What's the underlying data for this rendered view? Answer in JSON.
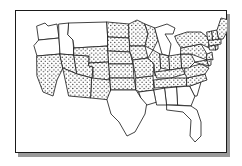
{
  "figure": {
    "frame": {
      "border_color": "#1a1a1a",
      "shadow_color": "#9a9a9a",
      "background_color": "#ffffff"
    }
  },
  "legend": {
    "shaded_meaning": "shaded (stippled) state",
    "unshaded_meaning": "unshaded (white) state",
    "stipple_color": "#1c1c1c",
    "outline_color": "#222222"
  },
  "map": {
    "region": "Contiguous United States",
    "projection": "simplified",
    "shaded_count": 35,
    "unshaded_count": 13,
    "states": [
      {
        "code": "WA",
        "name": "Washington",
        "shaded": false
      },
      {
        "code": "OR",
        "name": "Oregon",
        "shaded": false
      },
      {
        "code": "ID",
        "name": "Idaho",
        "shaded": false
      },
      {
        "code": "MT",
        "name": "Montana",
        "shaded": false
      },
      {
        "code": "CA",
        "name": "California",
        "shaded": true
      },
      {
        "code": "NV",
        "name": "Nevada",
        "shaded": true
      },
      {
        "code": "UT",
        "name": "Utah",
        "shaded": true
      },
      {
        "code": "AZ",
        "name": "Arizona",
        "shaded": true
      },
      {
        "code": "WY",
        "name": "Wyoming",
        "shaded": true
      },
      {
        "code": "CO",
        "name": "Colorado",
        "shaded": true
      },
      {
        "code": "NM",
        "name": "New Mexico",
        "shaded": true
      },
      {
        "code": "ND",
        "name": "North Dakota",
        "shaded": true
      },
      {
        "code": "SD",
        "name": "South Dakota",
        "shaded": true
      },
      {
        "code": "NE",
        "name": "Nebraska",
        "shaded": true
      },
      {
        "code": "KS",
        "name": "Kansas",
        "shaded": true
      },
      {
        "code": "OK",
        "name": "Oklahoma",
        "shaded": true
      },
      {
        "code": "TX",
        "name": "Texas",
        "shaded": false
      },
      {
        "code": "MN",
        "name": "Minnesota",
        "shaded": true
      },
      {
        "code": "IA",
        "name": "Iowa",
        "shaded": true
      },
      {
        "code": "MO",
        "name": "Missouri",
        "shaded": true
      },
      {
        "code": "AR",
        "name": "Arkansas",
        "shaded": true
      },
      {
        "code": "LA",
        "name": "Louisiana",
        "shaded": false
      },
      {
        "code": "WI",
        "name": "Wisconsin",
        "shaded": true
      },
      {
        "code": "IL",
        "name": "Illinois",
        "shaded": true
      },
      {
        "code": "MI",
        "name": "Michigan",
        "shaded": false
      },
      {
        "code": "IN",
        "name": "Indiana",
        "shaded": true
      },
      {
        "code": "OH",
        "name": "Ohio",
        "shaded": true
      },
      {
        "code": "KY",
        "name": "Kentucky",
        "shaded": true
      },
      {
        "code": "TN",
        "name": "Tennessee",
        "shaded": true
      },
      {
        "code": "MS",
        "name": "Mississippi",
        "shaded": false
      },
      {
        "code": "AL",
        "name": "Alabama",
        "shaded": false
      },
      {
        "code": "GA",
        "name": "Georgia",
        "shaded": false
      },
      {
        "code": "FL",
        "name": "Florida",
        "shaded": false
      },
      {
        "code": "SC",
        "name": "South Carolina",
        "shaded": false
      },
      {
        "code": "NC",
        "name": "North Carolina",
        "shaded": true
      },
      {
        "code": "VA",
        "name": "Virginia",
        "shaded": true
      },
      {
        "code": "WV",
        "name": "West Virginia",
        "shaded": true
      },
      {
        "code": "MD",
        "name": "Maryland",
        "shaded": true
      },
      {
        "code": "DE",
        "name": "Delaware",
        "shaded": true
      },
      {
        "code": "PA",
        "name": "Pennsylvania",
        "shaded": true
      },
      {
        "code": "NJ",
        "name": "New Jersey",
        "shaded": true
      },
      {
        "code": "NY",
        "name": "New York",
        "shaded": true
      },
      {
        "code": "CT",
        "name": "Connecticut",
        "shaded": true
      },
      {
        "code": "RI",
        "name": "Rhode Island",
        "shaded": true
      },
      {
        "code": "MA",
        "name": "Massachusetts",
        "shaded": true
      },
      {
        "code": "VT",
        "name": "Vermont",
        "shaded": true
      },
      {
        "code": "NH",
        "name": "New Hampshire",
        "shaded": true
      },
      {
        "code": "ME",
        "name": "Maine",
        "shaded": true
      }
    ]
  }
}
